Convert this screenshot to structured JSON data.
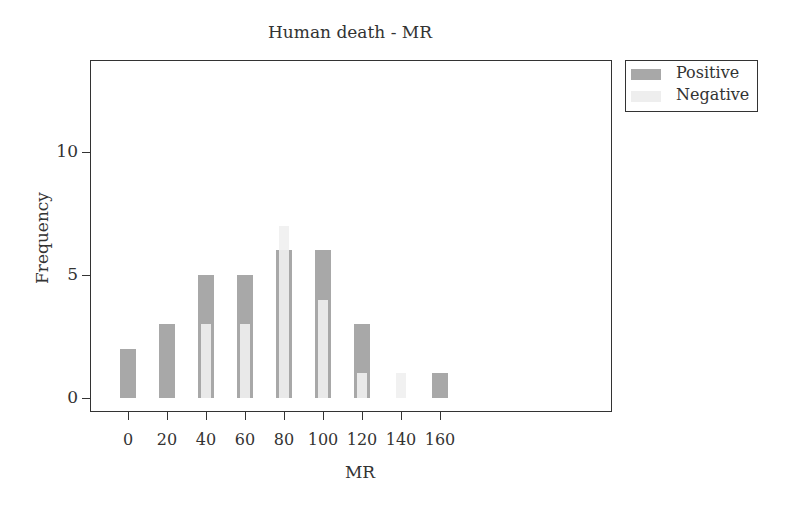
{
  "chart_data": {
    "type": "bar",
    "title": "Human death - MR",
    "xlabel": "MR",
    "ylabel": "Frequency",
    "categories": [
      "0",
      "20",
      "40",
      "60",
      "80",
      "100",
      "120",
      "140",
      "160"
    ],
    "series": [
      {
        "name": "Positive",
        "color": "#a8a8a8",
        "values": [
          2,
          3,
          5,
          5,
          6,
          6,
          3,
          0,
          1
        ]
      },
      {
        "name": "Negative",
        "color": "#f0f0f0",
        "values": [
          0,
          0,
          3,
          3,
          7,
          4,
          1,
          1,
          0
        ]
      }
    ],
    "yticks": [
      "0",
      "5",
      "10"
    ],
    "ylim": [
      -0.5,
      13.8
    ],
    "grid": false,
    "legend_position": "right-top"
  },
  "legend": {
    "items": [
      {
        "label": "Positive",
        "color": "#a8a8a8"
      },
      {
        "label": "Negative",
        "color": "#eeeeee"
      }
    ]
  }
}
